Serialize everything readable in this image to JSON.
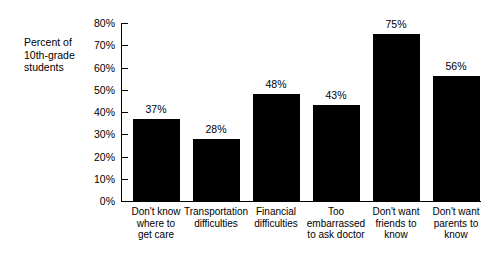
{
  "axis_note": "Percent of\n10th-grade\nstudents",
  "chart_data": {
    "type": "bar",
    "title": "",
    "subtitle": "",
    "xlabel": "",
    "ylabel": "Percent of 10th-grade students",
    "ylim": [
      0,
      80
    ],
    "grid": false,
    "legend": false,
    "orientation": "vertical",
    "bar_color": "#000000",
    "background_color": "#ffffff",
    "ytick_labels": [
      "0%",
      "10%",
      "20%",
      "30%",
      "40%",
      "50%",
      "60%",
      "70%",
      "80%"
    ],
    "ytick_values": [
      0,
      10,
      20,
      30,
      40,
      50,
      60,
      70,
      80
    ],
    "categories": [
      "Don't know\nwhere to\nget care",
      "Transportation\ndifficulties",
      "Financial\ndifficulties",
      "Too\nembarrassed\nto ask doctor",
      "Don't want\nfriends to\nknow",
      "Don't want\nparents to\nknow"
    ],
    "values": [
      37,
      28,
      48,
      43,
      75,
      56
    ],
    "data_labels": [
      "37%",
      "28%",
      "48%",
      "43%",
      "75%",
      "56%"
    ]
  }
}
